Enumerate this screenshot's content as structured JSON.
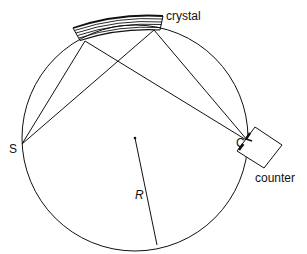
{
  "diagram": {
    "labels": {
      "crystal": "crystal",
      "source": "S",
      "counter_point": "C",
      "counter": "counter",
      "radius": "R"
    },
    "colors": {
      "stroke": "#111111",
      "background": "#ffffff"
    },
    "geometry": {
      "circle_center": [
        135,
        138
      ],
      "circle_radius": 113,
      "source_point": [
        22,
        144
      ],
      "counter_point": [
        248,
        141
      ],
      "crystal_reflection_points": [
        [
          85,
          41
        ],
        [
          154,
          30
        ]
      ],
      "radius_end": [
        157,
        245
      ]
    }
  }
}
